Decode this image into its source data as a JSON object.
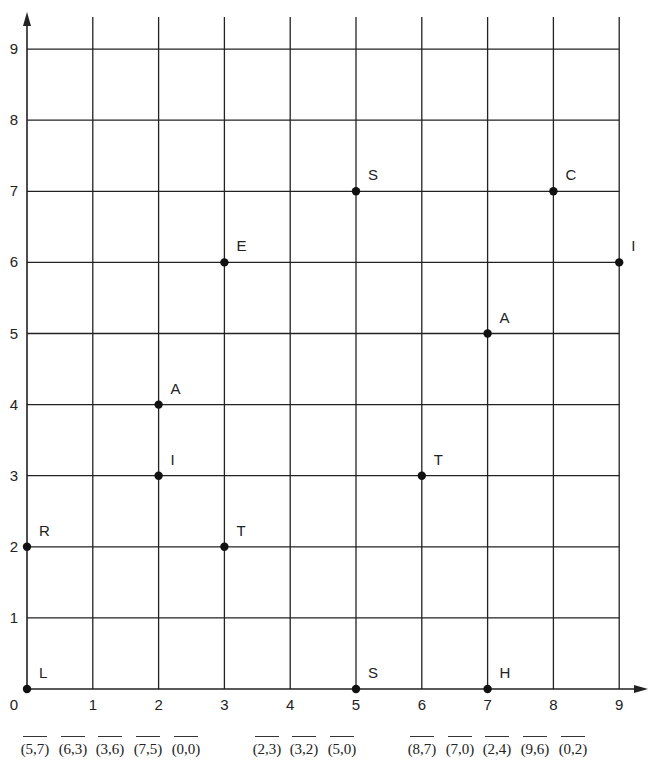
{
  "grid": {
    "x_min": 0,
    "x_max": 9,
    "y_min": 0,
    "y_max": 9,
    "x_ticks": [
      "0",
      "1",
      "2",
      "3",
      "4",
      "5",
      "6",
      "7",
      "8",
      "9"
    ],
    "y_ticks": [
      "1",
      "2",
      "3",
      "4",
      "5",
      "6",
      "7",
      "8",
      "9"
    ],
    "line_color": "#222222"
  },
  "points": [
    {
      "label": "L",
      "x": 0,
      "y": 0
    },
    {
      "label": "R",
      "x": 0,
      "y": 2
    },
    {
      "label": "I",
      "x": 2,
      "y": 3
    },
    {
      "label": "A",
      "x": 2,
      "y": 4
    },
    {
      "label": "T",
      "x": 3,
      "y": 2
    },
    {
      "label": "E",
      "x": 3,
      "y": 6
    },
    {
      "label": "S",
      "x": 5,
      "y": 7
    },
    {
      "label": "S",
      "x": 5,
      "y": 0
    },
    {
      "label": "T",
      "x": 6,
      "y": 3
    },
    {
      "label": "A",
      "x": 7,
      "y": 5
    },
    {
      "label": "H",
      "x": 7,
      "y": 0
    },
    {
      "label": "C",
      "x": 8,
      "y": 7
    },
    {
      "label": "I",
      "x": 9,
      "y": 6
    }
  ],
  "answer_blanks": [
    {
      "coord": "(5,7)"
    },
    {
      "coord": "(6,3)"
    },
    {
      "coord": "(3,6)"
    },
    {
      "coord": "(7,5)"
    },
    {
      "coord": "(0,0)"
    },
    {
      "coord": "(2,3)"
    },
    {
      "coord": "(3,2)"
    },
    {
      "coord": "(5,0)"
    },
    {
      "coord": "(8,7)"
    },
    {
      "coord": "(7,0)"
    },
    {
      "coord": "(2,4)"
    },
    {
      "coord": "(9,6)"
    },
    {
      "coord": "(0,2)"
    }
  ],
  "chart_data": {
    "type": "scatter",
    "title": "",
    "xlabel": "",
    "ylabel": "",
    "xlim": [
      0,
      9
    ],
    "ylim": [
      0,
      9
    ],
    "grid": true,
    "x": [
      0,
      0,
      2,
      2,
      3,
      3,
      5,
      5,
      6,
      7,
      7,
      8,
      9
    ],
    "y": [
      0,
      2,
      3,
      4,
      2,
      6,
      7,
      0,
      3,
      5,
      0,
      7,
      6
    ],
    "labels": [
      "L",
      "R",
      "I",
      "A",
      "T",
      "E",
      "S",
      "S",
      "T",
      "A",
      "H",
      "C",
      "I"
    ]
  }
}
